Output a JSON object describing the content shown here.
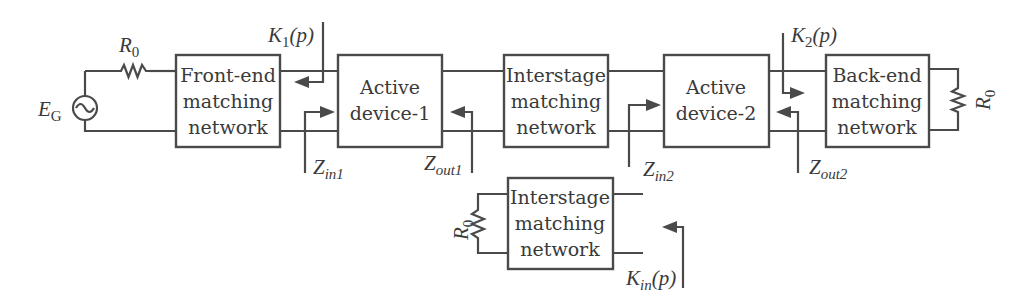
{
  "diagram": {
    "type": "two-stage amplifier block diagram",
    "source": {
      "label_main": "E",
      "label_sub": "G"
    },
    "source_resistor": {
      "label_main": "R",
      "label_sub": "0"
    },
    "load_resistor": {
      "label_main": "R",
      "label_sub": "0"
    },
    "aux_resistor": {
      "label_main": "R",
      "label_sub": "0"
    },
    "blocks": {
      "front_end": {
        "line1": "Front-end",
        "line2": "matching",
        "line3": "network"
      },
      "active1": {
        "line1": "Active",
        "line2": "device-1"
      },
      "interstage": {
        "line1": "Interstage",
        "line2": "matching",
        "line3": "network"
      },
      "active2": {
        "line1": "Active",
        "line2": "device-2"
      },
      "back_end": {
        "line1": "Back-end",
        "line2": "matching",
        "line3": "network"
      },
      "interstage_test": {
        "line1": "Interstage",
        "line2": "matching",
        "line3": "network"
      }
    },
    "ports": {
      "k1": {
        "main": "K",
        "sub": "1",
        "arg": "(p)"
      },
      "k2": {
        "main": "K",
        "sub": "2",
        "arg": "(p)"
      },
      "kin": {
        "main": "K",
        "sub": "in",
        "arg": "(p)"
      },
      "zin1": {
        "main": "Z",
        "sub": "in1"
      },
      "zout1": {
        "main": "Z",
        "sub": "out1"
      },
      "zin2": {
        "main": "Z",
        "sub": "in2"
      },
      "zout2": {
        "main": "Z",
        "sub": "out2"
      }
    },
    "colors": {
      "stroke": "#4a4a4a",
      "text": "#3a3a3a",
      "background": "#ffffff"
    }
  }
}
